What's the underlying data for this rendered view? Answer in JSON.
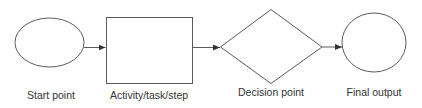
{
  "diagram": {
    "type": "flowchart",
    "colors": {
      "stroke": "#5a5a5a",
      "text": "#333333",
      "background": "#ffffff"
    },
    "nodes": [
      {
        "id": "start",
        "shape": "ellipse",
        "label": "Start point"
      },
      {
        "id": "activity",
        "shape": "rectangle",
        "label": "Activity/task/step"
      },
      {
        "id": "decision",
        "shape": "diamond",
        "label": "Decision point"
      },
      {
        "id": "final",
        "shape": "ellipse",
        "label": "Final output"
      }
    ],
    "edges": [
      {
        "from": "start",
        "to": "activity"
      },
      {
        "from": "activity",
        "to": "decision"
      },
      {
        "from": "decision",
        "to": "final"
      }
    ]
  }
}
